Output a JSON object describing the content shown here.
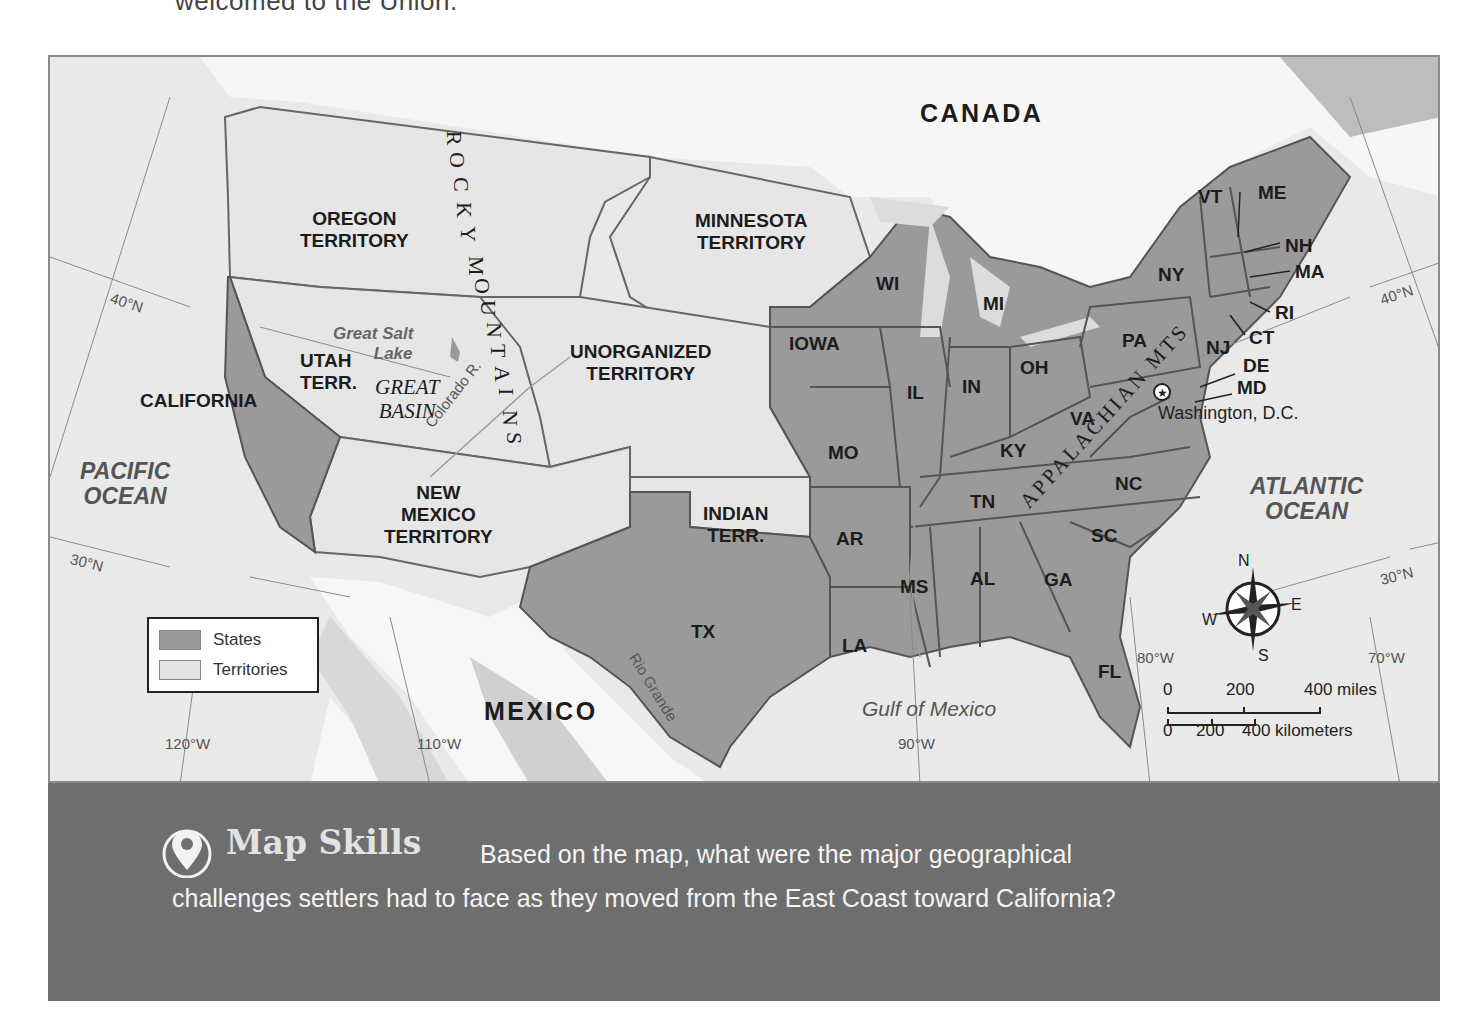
{
  "page": {
    "top_text": "welcomed to the Union."
  },
  "map": {
    "countries": {
      "canada": "CANADA",
      "mexico": "MEXICO"
    },
    "oceans": {
      "pacific_line1": "PACIFIC",
      "pacific_line2": "OCEAN",
      "atlantic_line1": "ATLANTIC",
      "atlantic_line2": "OCEAN",
      "gulf": "Gulf of Mexico"
    },
    "territories": {
      "oregon_line1": "OREGON",
      "oregon_line2": "TERRITORY",
      "minnesota_line1": "MINNESOTA",
      "minnesota_line2": "TERRITORY",
      "utah_line1": "UTAH",
      "utah_line2": "TERR.",
      "unorganized_line1": "UNORGANIZED",
      "unorganized_line2": "TERRITORY",
      "new_mexico_line1": "NEW",
      "new_mexico_line2": "MEXICO",
      "new_mexico_line3": "TERRITORY",
      "indian_line1": "INDIAN",
      "indian_line2": "TERR."
    },
    "states": {
      "california": "CALIFORNIA",
      "texas": "TX",
      "iowa": "IOWA",
      "wisconsin": "WI",
      "michigan": "MI",
      "illinois": "IL",
      "indiana": "IN",
      "ohio": "OH",
      "missouri": "MO",
      "kentucky": "KY",
      "virginia": "VA",
      "arkansas": "AR",
      "tennessee": "TN",
      "north_carolina": "NC",
      "south_carolina": "SC",
      "mississippi": "MS",
      "alabama": "AL",
      "georgia": "GA",
      "louisiana": "LA",
      "florida": "FL",
      "pennsylvania": "PA",
      "new_york": "NY",
      "new_jersey": "NJ",
      "vermont": "VT",
      "maine": "ME",
      "new_hampshire": "NH",
      "massachusetts": "MA",
      "rhode_island": "RI",
      "connecticut": "CT",
      "delaware": "DE",
      "maryland": "MD"
    },
    "physical": {
      "great_salt_lake_line1": "Great Salt",
      "great_salt_lake_line2": "Lake",
      "great_basin_line1": "GREAT",
      "great_basin_line2": "BASIN",
      "colorado_river": "Colorado R.",
      "rio_grande": "Rio Grande",
      "rocky_mountains": "ROCKY MOUNTAINS",
      "appalachian_mts": "APPALACHIAN MTS"
    },
    "capital": {
      "label": "Washington, D.C.",
      "icon": "star-in-circle"
    },
    "grid_labels": {
      "lat_40_left": "40°N",
      "lat_30_left": "30°N",
      "lat_40_right": "40°N",
      "lat_30_right": "30°N",
      "lon_120": "120°W",
      "lon_110": "110°W",
      "lon_90": "90°W",
      "lon_80": "80°W",
      "lon_70": "70°W"
    },
    "compass": {
      "n": "N",
      "s": "S",
      "e": "E",
      "w": "W"
    },
    "scale_bar": {
      "miles_0": "0",
      "miles_200": "200",
      "miles_400": "400 miles",
      "km_0": "0",
      "km_200": "200",
      "km_400": "400 kilometers"
    },
    "legend": {
      "items": [
        {
          "label": "States",
          "color": "#9a9a9a"
        },
        {
          "label": "Territories",
          "color": "#e4e4e4"
        }
      ]
    },
    "colors": {
      "state_fill": "#9a9a9a",
      "territory_fill": "#e6e6e6",
      "ocean_fill": "#e9e9e9",
      "foreign_land": "#f7f7f7",
      "border": "#555555",
      "skills_bar": "#6e6e6e"
    }
  },
  "map_skills": {
    "icon": "map-pin-icon",
    "heading": "Map Skills",
    "question": "Based on the map, what were the major geographical challenges settlers had to face as they moved from the East Coast toward California?"
  }
}
